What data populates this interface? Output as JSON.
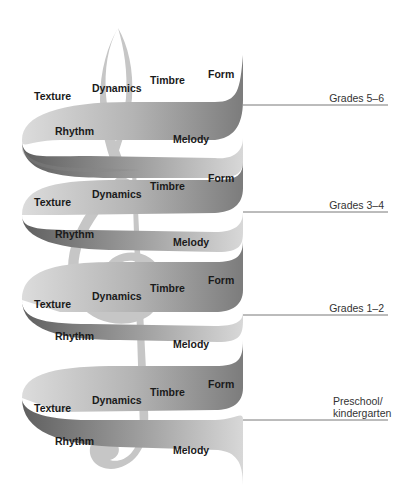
{
  "diagram": {
    "colors": {
      "ribbon_light": "#d6d6d6",
      "ribbon_mid": "#a8a8a8",
      "ribbon_dark": "#6e6e6e",
      "clef": "#c4c4c4",
      "text": "#1a1a1a",
      "grade_line": "#555555"
    },
    "coils": [
      {
        "grade": "Grades 5–6",
        "front": [
          "Texture",
          "Dynamics",
          "Timbre",
          "Form"
        ],
        "back": [
          "Rhythm",
          "Melody"
        ]
      },
      {
        "grade": "Grades 3–4",
        "front": [
          "Texture",
          "Dynamics",
          "Timbre",
          "Form"
        ],
        "back": [
          "Rhythm",
          "Melody"
        ]
      },
      {
        "grade": "Grades 1–2",
        "front": [
          "Texture",
          "Dynamics",
          "Timbre",
          "Form"
        ],
        "back": [
          "Rhythm",
          "Melody"
        ]
      },
      {
        "grade_line1": "Preschool/",
        "grade_line2": "kindergarten",
        "front": [
          "Texture",
          "Dynamics",
          "Timbre",
          "Form"
        ],
        "back": [
          "Rhythm",
          "Melody"
        ]
      }
    ]
  }
}
